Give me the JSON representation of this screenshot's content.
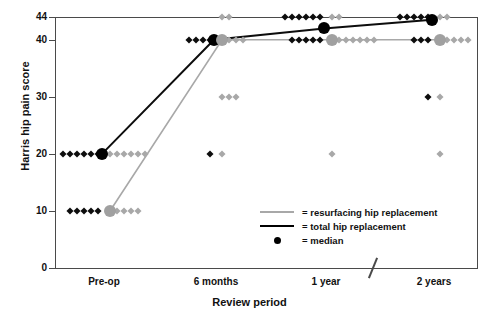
{
  "chart_data": {
    "type": "scatter",
    "title": "",
    "xlabel": "Review period",
    "ylabel": "Harris hip pain score",
    "categories": [
      "Pre-op",
      "6 months",
      "1 year",
      "2 years"
    ],
    "ylim": [
      0,
      44
    ],
    "yticks": [
      0,
      10,
      20,
      30,
      40,
      44
    ],
    "ytick_labels": [
      "0",
      "10",
      "20",
      "30",
      "40",
      "44"
    ],
    "grid": false,
    "legend_position": "inside-lower-right",
    "axis_break": {
      "between": [
        "1 year",
        "2 years"
      ],
      "label": "/"
    },
    "series": [
      {
        "name": "resurfacing hip replacement",
        "color": "#a8a8a8",
        "marker": "diamond",
        "median_values": [
          10,
          40,
          40,
          40
        ],
        "points": [
          {
            "x": "Pre-op",
            "y": 20,
            "count": 6
          },
          {
            "x": "Pre-op",
            "y": 10,
            "count": 5
          },
          {
            "x": "6 months",
            "y": 44,
            "count": 2
          },
          {
            "x": "6 months",
            "y": 40,
            "count": 4
          },
          {
            "x": "6 months",
            "y": 30,
            "count": 3
          },
          {
            "x": "6 months",
            "y": 20,
            "count": 1
          },
          {
            "x": "1 year",
            "y": 44,
            "count": 2
          },
          {
            "x": "1 year",
            "y": 40,
            "count": 7
          },
          {
            "x": "1 year",
            "y": 20,
            "count": 1
          },
          {
            "x": "2 years",
            "y": 44,
            "count": 2
          },
          {
            "x": "2 years",
            "y": 40,
            "count": 5
          },
          {
            "x": "2 years",
            "y": 30,
            "count": 1
          },
          {
            "x": "2 years",
            "y": 20,
            "count": 1
          }
        ]
      },
      {
        "name": "total hip replacement",
        "color": "#0d0d0d",
        "marker": "diamond",
        "median_values": [
          20,
          40,
          42,
          43.5
        ],
        "points": [
          {
            "x": "Pre-op",
            "y": 20,
            "count": 6
          },
          {
            "x": "Pre-op",
            "y": 10,
            "count": 5
          },
          {
            "x": "6 months",
            "y": 40,
            "count": 4
          },
          {
            "x": "6 months",
            "y": 20,
            "count": 1
          },
          {
            "x": "1 year",
            "y": 44,
            "count": 6
          },
          {
            "x": "1 year",
            "y": 40,
            "count": 5
          },
          {
            "x": "2 years",
            "y": 44,
            "count": 5
          },
          {
            "x": "2 years",
            "y": 40,
            "count": 3
          },
          {
            "x": "2 years",
            "y": 30,
            "count": 1
          }
        ]
      }
    ],
    "legend": [
      {
        "key": "resurfacing-line",
        "label": "= resurfacing hip replacement"
      },
      {
        "key": "total-line",
        "label": "= total hip replacement"
      },
      {
        "key": "median-dot",
        "label": "= median"
      }
    ]
  }
}
